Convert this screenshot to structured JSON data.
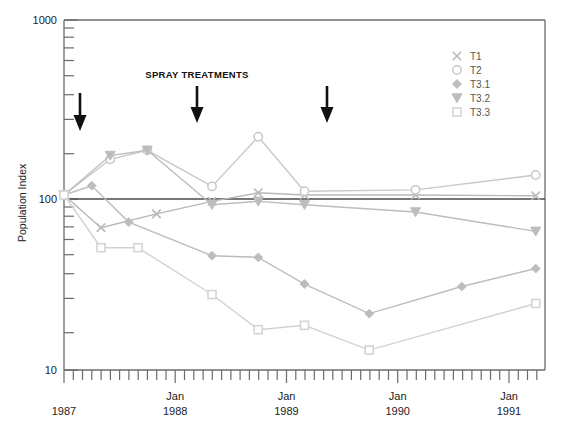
{
  "chart_data": {
    "type": "line",
    "title": "",
    "xlabel": "",
    "ylabel": "Population Index",
    "yscale": "log",
    "ylim": [
      10,
      1000
    ],
    "ytick_labels": [
      "1000",
      "100",
      "10"
    ],
    "ytick_values": [
      1000,
      100,
      10
    ],
    "grid": false,
    "reference_line": 100,
    "x_axis": {
      "tick_interval": "monthly",
      "categories": [
        "1987",
        "Jan\n1988",
        "Jan\n1989",
        "Jan\n1990",
        "Jan\n1991"
      ],
      "category_labels": [
        {
          "top": "",
          "bottom": "1987"
        },
        {
          "top": "Jan",
          "bottom": "1988"
        },
        {
          "top": "Jan",
          "bottom": "1989"
        },
        {
          "top": "Jan",
          "bottom": "1990"
        },
        {
          "top": "Jan",
          "bottom": "1991"
        }
      ],
      "range_months": [
        0,
        52
      ]
    },
    "annotations": [
      {
        "label": "SPRAY TREATMENTS",
        "type": "text"
      },
      {
        "label": "",
        "type": "arrow",
        "x_month": 2
      },
      {
        "label": "",
        "type": "arrow",
        "x_month": 13
      },
      {
        "label": "",
        "type": "arrow",
        "x_month": 25
      }
    ],
    "legend": {
      "position": "top-right",
      "entries": [
        {
          "name": "T1",
          "marker": "cross-x"
        },
        {
          "name": "T2",
          "marker": "open-circle"
        },
        {
          "name": "T3.1",
          "marker": "filled-diamond"
        },
        {
          "name": "T3.2",
          "marker": "filled-triangle-down"
        },
        {
          "name": "T3.3",
          "marker": "open-square"
        }
      ]
    },
    "series": [
      {
        "name": "T1",
        "marker": "cross-x",
        "color": "#b8b8b8",
        "points": [
          {
            "x_month": 0,
            "value": 100
          },
          {
            "x_month": 4,
            "value": 65
          },
          {
            "x_month": 10,
            "value": 78
          },
          {
            "x_month": 16,
            "value": 92
          },
          {
            "x_month": 21,
            "value": 103
          },
          {
            "x_month": 26,
            "value": 100
          },
          {
            "x_month": 38,
            "value": 100
          },
          {
            "x_month": 51,
            "value": 99
          }
        ]
      },
      {
        "name": "T2",
        "marker": "open-circle",
        "color": "#c8c8c8",
        "points": [
          {
            "x_month": 0,
            "value": 100
          },
          {
            "x_month": 5,
            "value": 160
          },
          {
            "x_month": 9,
            "value": 180
          },
          {
            "x_month": 16,
            "value": 112
          },
          {
            "x_month": 21,
            "value": 215
          },
          {
            "x_month": 26,
            "value": 105
          },
          {
            "x_month": 38,
            "value": 107
          },
          {
            "x_month": 51,
            "value": 130
          }
        ]
      },
      {
        "name": "T3.1",
        "marker": "filled-diamond",
        "color": "#bdbdbd",
        "points": [
          {
            "x_month": 0,
            "value": 100
          },
          {
            "x_month": 3,
            "value": 113
          },
          {
            "x_month": 7,
            "value": 70
          },
          {
            "x_month": 16,
            "value": 45
          },
          {
            "x_month": 21,
            "value": 44
          },
          {
            "x_month": 26,
            "value": 31
          },
          {
            "x_month": 33,
            "value": 21
          },
          {
            "x_month": 43,
            "value": 30
          },
          {
            "x_month": 51,
            "value": 38
          }
        ]
      },
      {
        "name": "T3.2",
        "marker": "filled-triangle-down",
        "color": "#bdbdbd",
        "points": [
          {
            "x_month": 0,
            "value": 100
          },
          {
            "x_month": 5,
            "value": 168
          },
          {
            "x_month": 9,
            "value": 180
          },
          {
            "x_month": 16,
            "value": 88
          },
          {
            "x_month": 21,
            "value": 92
          },
          {
            "x_month": 26,
            "value": 88
          },
          {
            "x_month": 38,
            "value": 80
          },
          {
            "x_month": 51,
            "value": 62
          }
        ]
      },
      {
        "name": "T3.3",
        "marker": "open-square",
        "color": "#d2d2d2",
        "points": [
          {
            "x_month": 0,
            "value": 100
          },
          {
            "x_month": 4,
            "value": 50
          },
          {
            "x_month": 8,
            "value": 50
          },
          {
            "x_month": 16,
            "value": 27
          },
          {
            "x_month": 21,
            "value": 17
          },
          {
            "x_month": 26,
            "value": 18
          },
          {
            "x_month": 33,
            "value": 13
          },
          {
            "x_month": 51,
            "value": 24
          }
        ]
      }
    ]
  },
  "axis": {
    "y_label": "Population Index",
    "y_ticks": [
      "1000",
      "100",
      "10"
    ]
  },
  "annotation_text": {
    "spray": "SPRAY TREATMENTS"
  },
  "legend_items": {
    "t1": "T1",
    "t2": "T2",
    "t31": "T3.1",
    "t32": "T3.2",
    "t33": "T3.3"
  },
  "x_labels": {
    "c0_top": "",
    "c0_bottom": "1987",
    "c1_top": "Jan",
    "c1_bottom": "1988",
    "c2_top": "Jan",
    "c2_bottom": "1989",
    "c3_top": "Jan",
    "c3_bottom": "1990",
    "c4_top": "Jan",
    "c4_bottom": "1991"
  },
  "colors": {
    "axis": "#6b6b6b",
    "reference_line": "#4a4a4a",
    "arrow": "#111111",
    "text": "#222222"
  }
}
